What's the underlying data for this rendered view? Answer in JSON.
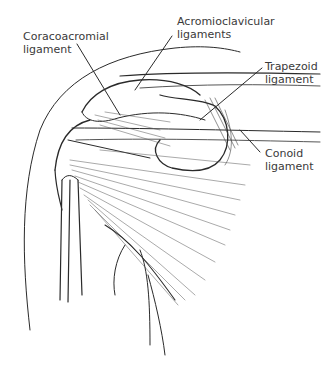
{
  "figure": {
    "ink_color": "#2a2a2a",
    "label_color": "#3a3a3a",
    "background": "#ffffff"
  },
  "labels": {
    "coracoacromial": {
      "line1": "Coracoacromial",
      "line2": "ligament"
    },
    "acromioclavicular": {
      "line1": "Acromioclavicular",
      "line2": "ligaments"
    },
    "trapezoid": {
      "line1": "Trapezoid",
      "line2": "ligament"
    },
    "conoid": {
      "line1": "Conoid",
      "line2": "ligament"
    }
  }
}
